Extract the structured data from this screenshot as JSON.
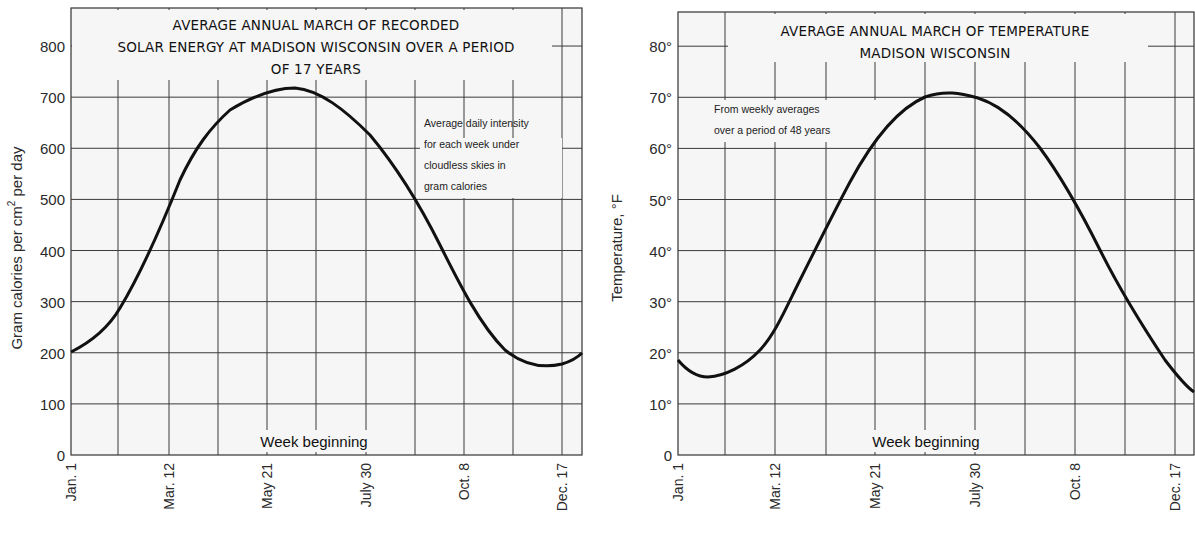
{
  "chart_data": [
    {
      "type": "line",
      "title": "AVERAGE ANNUAL MARCH OF RECORDED SOLAR ENERGY AT MADISON WISCONSIN OVER A PERIOD OF 17 YEARS",
      "title_lines": [
        "AVERAGE ANNUAL MARCH OF RECORDED",
        "SOLAR ENERGY AT MADISON WISCONSIN OVER A PERIOD",
        "OF 17 YEARS"
      ],
      "annotation_lines": [
        "Average daily intensity",
        "for each week under",
        "cloudless skies in",
        "gram calories"
      ],
      "xlabel": "Week beginning",
      "ylabel": "Gram  calories  per  cm²  per  day",
      "ylabel_parts": {
        "main": "Gram  calories  per  cm",
        "sup": "2",
        "tail": "  per  day"
      },
      "ylim": [
        0,
        800
      ],
      "yticks": [
        0,
        100,
        200,
        300,
        400,
        500,
        600,
        700,
        800
      ],
      "ytick_labels": [
        "0",
        "100",
        "200",
        "300",
        "400",
        "500",
        "600",
        "700",
        "800"
      ],
      "xtick_labels": [
        "Jan. 1",
        "Mar. 12",
        "May 21",
        "July 30",
        "Oct. 8",
        "Dec. 17"
      ],
      "grid": true,
      "series": [
        {
          "name": "Solar energy",
          "x": [
            "Jan. 1",
            "Feb. 5",
            "Mar. 12",
            "Apr. 16",
            "May 21",
            "June 25",
            "July 30",
            "Sep. 3",
            "Oct. 8",
            "Nov. 12",
            "Dec. 17",
            "Dec. 31"
          ],
          "values": [
            200,
            290,
            450,
            610,
            690,
            710,
            610,
            460,
            300,
            200,
            180,
            195
          ]
        }
      ]
    },
    {
      "type": "line",
      "title": "AVERAGE ANNUAL MARCH OF TEMPERATURE MADISON WISCONSIN",
      "title_lines": [
        "AVERAGE ANNUAL MARCH OF TEMPERATURE",
        "MADISON WISCONSIN"
      ],
      "annotation_lines": [
        "From weekly averages",
        "over a period of 48 years"
      ],
      "xlabel": "Week beginning",
      "ylabel": "Temperature, °F",
      "ylim": [
        0,
        85
      ],
      "yticks": [
        0,
        10,
        20,
        30,
        40,
        50,
        60,
        70,
        80
      ],
      "ytick_labels": [
        "0",
        "10°",
        "20°",
        "30°",
        "40°",
        "50°",
        "60°",
        "70°",
        "80°"
      ],
      "xtick_labels": [
        "Jan. 1",
        "Mar. 12",
        "May 21",
        "July 30",
        "Oct. 8",
        "Dec. 17"
      ],
      "grid": true,
      "series": [
        {
          "name": "Temperature",
          "x": [
            "Jan. 1",
            "Jan. 20",
            "Feb. 5",
            "Mar. 12",
            "Apr. 16",
            "May 21",
            "June 25",
            "July 30",
            "Sep. 3",
            "Oct. 8",
            "Nov. 12",
            "Dec. 17",
            "Dec. 31"
          ],
          "values": [
            19,
            15.5,
            17,
            26,
            43,
            58,
            68,
            71,
            66,
            51,
            35,
            22,
            18
          ]
        }
      ]
    }
  ]
}
